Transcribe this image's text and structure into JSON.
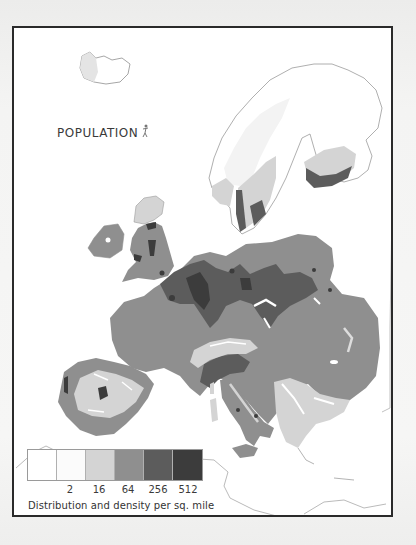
{
  "map": {
    "title": "POPULATION",
    "title_icon": "human-figure-icon",
    "region": "Europe",
    "legend": {
      "caption": "Distribution and density per  sq. mile",
      "tick_labels": [
        "2",
        "16",
        "64",
        "256",
        "512"
      ],
      "classes": [
        {
          "range": "0-2",
          "color": "#ffffff"
        },
        {
          "range": "2-16",
          "color": "#fbfbfb"
        },
        {
          "range": "16-64",
          "color": "#d4d4d4"
        },
        {
          "range": "64-256",
          "color": "#8f8f8f"
        },
        {
          "range": "256-512",
          "color": "#5c5c5c"
        },
        {
          "range": ">512",
          "color": "#3c3c3c"
        }
      ]
    },
    "colors": {
      "frame": "#2a2a2a",
      "coast_line": "#9a9a9a",
      "very_sparse": "#ffffff",
      "sparse": "#d4d4d4",
      "medium": "#8f8f8f",
      "dense": "#5c5c5c",
      "very_dense": "#3c3c3c"
    }
  }
}
